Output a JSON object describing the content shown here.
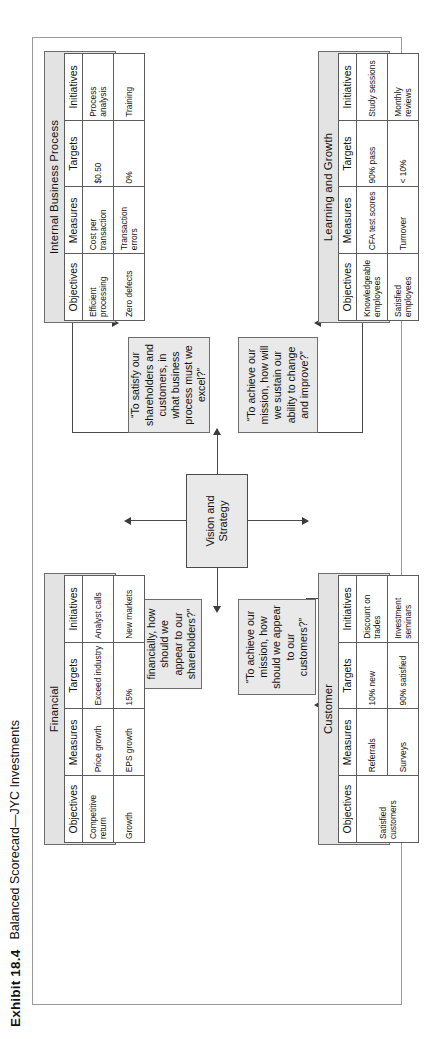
{
  "caption": {
    "exhibit": "Exhibit 18.4",
    "title": "Balanced Scorecard—JYC Investments"
  },
  "center": {
    "label": "Vision and\nStrategy",
    "line1": "Vision and",
    "line2": "Strategy"
  },
  "columns": {
    "objectives": "Objectives",
    "measures": "Measures",
    "targets": "Targets",
    "initiatives": "Initiatives"
  },
  "perspectives": {
    "financial": {
      "title": "Financial",
      "question": "“To succeed financially, how should we appear to our shareholders?”",
      "headers": [
        "Objectives",
        "Measures",
        "Targets",
        "Initiatives"
      ],
      "rows": [
        [
          "Competitive return",
          "Price growth",
          "Exceed industry",
          "Analyst calls"
        ],
        [
          "Growth",
          "EPS growth",
          "15%",
          "New markets"
        ]
      ]
    },
    "customer": {
      "title": "Customer",
      "question": "“To achieve our mission, how should we appear to our customers?”",
      "headers": [
        "Objectives",
        "Measures",
        "Targets",
        "Initiatives"
      ],
      "rows": [
        [
          "Satisfied customers",
          "Referrals",
          "10% new",
          "Discount on trades"
        ],
        [
          "",
          "Surveys",
          "90% satisfied",
          "Investment seminars"
        ]
      ]
    },
    "internal": {
      "title": "Internal Business Process",
      "question": "“To satisfy our shareholders and customers, in what business process must we excel?”",
      "headers": [
        "Objectives",
        "Measures",
        "Targets",
        "Initiatives"
      ],
      "rows": [
        [
          "Efficient processing",
          "Cost per transaction",
          "$0.50",
          "Process analysis"
        ],
        [
          "Zero defects",
          "Transaction errors",
          "0%",
          "Training"
        ]
      ]
    },
    "learning": {
      "title": "Learning and Growth",
      "question": "“To achieve our mission, how will we sustain our ability to change and improve?”",
      "headers": [
        "Objectives",
        "Measures",
        "Targets",
        "Initiatives"
      ],
      "rows": [
        [
          "Knowledgeable employees",
          "CFA test scores",
          "90% pass",
          "Study sessions"
        ],
        [
          "Satisfied employees",
          "Turnover",
          "< 10%",
          "Monthly reviews"
        ]
      ]
    }
  },
  "colors": {
    "box_fill": "#e9e9e9",
    "panel_fill": "#e3e3e3",
    "line": "#4a4a4a",
    "border": "#6d6d6d"
  }
}
